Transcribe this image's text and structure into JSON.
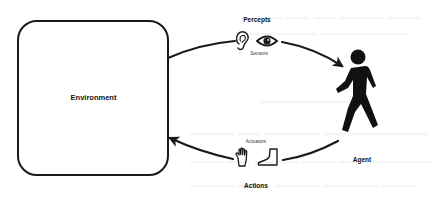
{
  "diagram": {
    "type": "agent-environment-loop",
    "environment": {
      "label": "Environment"
    },
    "agent": {
      "label": "Agent",
      "icon": "walking-person-icon"
    },
    "percepts": {
      "label": "Percepts",
      "sublabel": "Sensors",
      "icons": [
        "ear-icon",
        "eye-icon"
      ],
      "direction": "environment-to-agent"
    },
    "actions": {
      "label": "Actions",
      "sublabel": "Actuators",
      "icons": [
        "hand-icon",
        "foot-icon"
      ],
      "direction": "agent-to-environment"
    },
    "colors": {
      "stroke": "#1a1a1a",
      "background": "#ffffff",
      "text": "#111111"
    }
  }
}
